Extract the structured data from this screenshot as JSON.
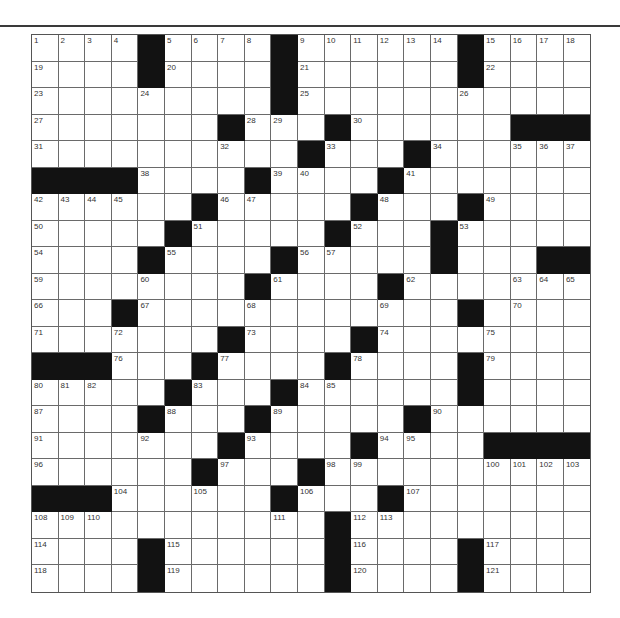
{
  "puzzle": {
    "rows": 21,
    "cols": 21,
    "colors": {
      "block": "#121212",
      "cell": "#ffffff",
      "gridline": "#6a6a6a",
      "number": "#333333"
    },
    "layout": [
      "0000#0000#000000#0000",
      "0000#0000#000000#0000",
      "000000000#00000000000",
      "0000000#000#000000###",
      "0000000000#000#000000",
      "####0000#0000#0000000",
      "000000#00000#000#0000",
      "00000#00000#000#00000",
      "0000#0000#00000#000###",
      "00000000#0000#0000000",
      "000#000000000000#0000",
      "0000000#0000#00000000",
      "###000#0000#0000#0000",
      "00000#000#000000#0000",
      "0000#000#00000#000000",
      "0000000#0000#0000####",
      "000000#000#0000000000",
      "###000000#000#0000000",
      "00000000000#000000000",
      "0000#000000#0000#0000",
      "0000#000000#0000#0000"
    ],
    "numbers": [
      [
        1,
        2,
        3,
        4,
        0,
        5,
        6,
        7,
        8,
        0,
        9,
        10,
        11,
        12,
        13,
        14,
        0,
        15,
        16,
        17,
        18
      ],
      [
        19,
        0,
        0,
        0,
        0,
        20,
        0,
        0,
        0,
        0,
        21,
        0,
        0,
        0,
        0,
        0,
        0,
        22,
        0,
        0,
        0
      ],
      [
        23,
        0,
        0,
        0,
        24,
        0,
        0,
        0,
        0,
        0,
        25,
        0,
        0,
        0,
        0,
        0,
        26,
        0,
        0,
        0,
        0
      ],
      [
        27,
        0,
        0,
        0,
        0,
        0,
        0,
        0,
        28,
        29,
        0,
        0,
        30,
        0,
        0,
        0,
        0,
        0,
        0,
        0,
        0
      ],
      [
        31,
        0,
        0,
        0,
        0,
        0,
        0,
        32,
        0,
        0,
        0,
        33,
        0,
        0,
        0,
        34,
        0,
        0,
        35,
        36,
        37
      ],
      [
        0,
        0,
        0,
        0,
        38,
        0,
        0,
        0,
        0,
        39,
        40,
        0,
        0,
        0,
        41,
        0,
        0,
        0,
        0,
        0,
        0
      ],
      [
        42,
        43,
        44,
        45,
        0,
        0,
        0,
        46,
        47,
        0,
        0,
        0,
        0,
        48,
        0,
        0,
        0,
        49,
        0,
        0,
        0
      ],
      [
        50,
        0,
        0,
        0,
        0,
        0,
        51,
        0,
        0,
        0,
        0,
        0,
        52,
        0,
        0,
        0,
        53,
        0,
        0,
        0,
        0
      ],
      [
        54,
        0,
        0,
        0,
        0,
        55,
        0,
        0,
        0,
        0,
        56,
        57,
        0,
        0,
        0,
        58,
        0,
        0,
        0,
        0,
        0
      ],
      [
        59,
        0,
        0,
        0,
        60,
        0,
        0,
        0,
        0,
        61,
        0,
        0,
        0,
        0,
        62,
        0,
        0,
        0,
        63,
        64,
        65
      ],
      [
        66,
        0,
        0,
        0,
        67,
        0,
        0,
        0,
        68,
        0,
        0,
        0,
        0,
        69,
        0,
        0,
        0,
        0,
        70,
        0,
        0
      ],
      [
        71,
        0,
        0,
        72,
        0,
        0,
        0,
        0,
        73,
        0,
        0,
        0,
        0,
        74,
        0,
        0,
        0,
        75,
        0,
        0,
        0
      ],
      [
        0,
        0,
        0,
        76,
        0,
        0,
        0,
        77,
        0,
        0,
        0,
        0,
        78,
        0,
        0,
        0,
        0,
        79,
        0,
        0,
        0
      ],
      [
        80,
        81,
        82,
        0,
        0,
        0,
        83,
        0,
        0,
        0,
        84,
        85,
        0,
        0,
        0,
        0,
        86,
        0,
        0,
        0,
        0
      ],
      [
        87,
        0,
        0,
        0,
        0,
        88,
        0,
        0,
        0,
        89,
        0,
        0,
        0,
        0,
        0,
        90,
        0,
        0,
        0,
        0,
        0
      ],
      [
        91,
        0,
        0,
        0,
        92,
        0,
        0,
        0,
        93,
        0,
        0,
        0,
        0,
        94,
        95,
        0,
        0,
        0,
        0,
        0,
        0
      ],
      [
        96,
        0,
        0,
        0,
        0,
        0,
        0,
        97,
        0,
        0,
        0,
        98,
        99,
        0,
        0,
        0,
        0,
        100,
        101,
        102,
        103
      ],
      [
        0,
        0,
        0,
        104,
        0,
        0,
        105,
        0,
        0,
        0,
        106,
        0,
        0,
        0,
        107,
        0,
        0,
        0,
        0,
        0,
        0
      ],
      [
        108,
        109,
        110,
        0,
        0,
        0,
        0,
        0,
        0,
        111,
        0,
        0,
        112,
        113,
        0,
        0,
        0,
        0,
        0,
        0,
        0
      ],
      [
        114,
        0,
        0,
        0,
        0,
        115,
        0,
        0,
        0,
        0,
        0,
        0,
        116,
        0,
        0,
        0,
        0,
        117,
        0,
        0,
        0
      ],
      [
        118,
        0,
        0,
        0,
        0,
        119,
        0,
        0,
        0,
        0,
        0,
        0,
        120,
        0,
        0,
        0,
        0,
        121,
        0,
        0,
        0
      ]
    ]
  }
}
